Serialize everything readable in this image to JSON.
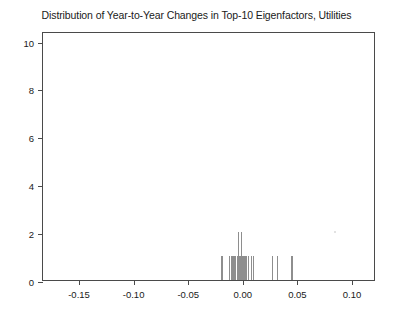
{
  "chart_data": {
    "type": "bar",
    "title": "Distribution of Year-to-Year Changes in Top-10 Eigenfactors, Utilities",
    "xlabel": "",
    "ylabel": "",
    "xlim": [
      -0.183,
      0.122
    ],
    "ylim": [
      0,
      10.4
    ],
    "grid": false,
    "legend": null,
    "xticks": [
      -0.15,
      -0.1,
      -0.05,
      0.0,
      0.05,
      0.1
    ],
    "xtick_labels": [
      "-0.15",
      "-0.10",
      "-0.05",
      "0.00",
      "0.05",
      "0.10"
    ],
    "yticks": [
      0,
      2,
      4,
      6,
      8,
      10
    ],
    "ytick_labels": [
      "0",
      "2",
      "4",
      "6",
      "8",
      "10"
    ],
    "bar_color": "#8e8e8e",
    "x": [
      -0.019,
      -0.012,
      -0.01,
      -0.008,
      -0.0065,
      -0.005,
      -0.004,
      -0.003,
      -0.002,
      -0.001,
      0.0,
      0.001,
      0.002,
      0.003,
      0.005,
      0.008,
      0.01,
      0.027,
      0.032,
      0.045
    ],
    "values": [
      1,
      1,
      1,
      1,
      1,
      1,
      2,
      1,
      1,
      2,
      1,
      1,
      1,
      1,
      1,
      1,
      1,
      1,
      1,
      1
    ],
    "annotations": [
      {
        "name": "faint-speck",
        "x": 0.0835,
        "y": 1.95
      }
    ]
  }
}
